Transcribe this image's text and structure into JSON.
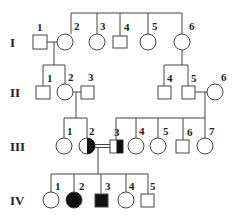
{
  "generations": [
    {
      "label": "I",
      "y": 42
    },
    {
      "label": "II",
      "y": 92
    },
    {
      "label": "III",
      "y": 146
    },
    {
      "label": "IV",
      "y": 200
    }
  ],
  "legend_note": "square = male, circle = female, filled = affected, half-filled = carrier, double line = consanguineous mating",
  "individuals": [
    {
      "id": "I-1",
      "num": "1",
      "sex": "male",
      "status": "unaffected",
      "x": 40,
      "y": 42
    },
    {
      "id": "I-2",
      "num": "2",
      "sex": "female",
      "status": "unaffected",
      "x": 65,
      "y": 42
    },
    {
      "id": "I-3",
      "num": "3",
      "sex": "female",
      "status": "unaffected",
      "x": 96,
      "y": 42
    },
    {
      "id": "I-4",
      "num": "4",
      "sex": "male",
      "status": "unaffected",
      "x": 120,
      "y": 42
    },
    {
      "id": "I-5",
      "num": "5",
      "sex": "female",
      "status": "unaffected",
      "x": 150,
      "y": 42
    },
    {
      "id": "I-6",
      "num": "6",
      "sex": "female",
      "status": "unaffected",
      "x": 182,
      "y": 42
    },
    {
      "id": "II-1",
      "num": "1",
      "sex": "male",
      "status": "unaffected",
      "x": 43,
      "y": 92
    },
    {
      "id": "II-2",
      "num": "2",
      "sex": "female",
      "status": "unaffected",
      "x": 65,
      "y": 92
    },
    {
      "id": "II-3",
      "num": "3",
      "sex": "male",
      "status": "unaffected",
      "x": 87,
      "y": 92
    },
    {
      "id": "II-4",
      "num": "4",
      "sex": "male",
      "status": "unaffected",
      "x": 164,
      "y": 92
    },
    {
      "id": "II-5",
      "num": "5",
      "sex": "male",
      "status": "unaffected",
      "x": 188,
      "y": 92
    },
    {
      "id": "II-6",
      "num": "6",
      "sex": "female",
      "status": "unaffected",
      "x": 215,
      "y": 92
    },
    {
      "id": "III-1",
      "num": "1",
      "sex": "female",
      "status": "unaffected",
      "x": 64,
      "y": 146
    },
    {
      "id": "III-2",
      "num": "2",
      "sex": "female",
      "status": "carrier",
      "x": 87,
      "y": 146
    },
    {
      "id": "III-3",
      "num": "3",
      "sex": "male",
      "status": "carrier",
      "x": 116,
      "y": 146
    },
    {
      "id": "III-4",
      "num": "4",
      "sex": "female",
      "status": "unaffected",
      "x": 136,
      "y": 146
    },
    {
      "id": "III-5",
      "num": "5",
      "sex": "female",
      "status": "unaffected",
      "x": 158,
      "y": 146
    },
    {
      "id": "III-6",
      "num": "6",
      "sex": "male",
      "status": "unaffected",
      "x": 183,
      "y": 146
    },
    {
      "id": "III-7",
      "num": "7",
      "sex": "female",
      "status": "unaffected",
      "x": 205,
      "y": 146
    },
    {
      "id": "IV-1",
      "num": "1",
      "sex": "female",
      "status": "unaffected",
      "x": 51,
      "y": 200
    },
    {
      "id": "IV-2",
      "num": "2",
      "sex": "female",
      "status": "affected",
      "x": 74,
      "y": 200
    },
    {
      "id": "IV-3",
      "num": "3",
      "sex": "male",
      "status": "affected",
      "x": 101,
      "y": 200
    },
    {
      "id": "IV-4",
      "num": "4",
      "sex": "female",
      "status": "unaffected",
      "x": 126,
      "y": 200
    },
    {
      "id": "IV-5",
      "num": "5",
      "sex": "male",
      "status": "unaffected",
      "x": 148,
      "y": 200
    }
  ],
  "matings": [
    {
      "a": "I-1",
      "b": "I-2",
      "consanguineous": false
    },
    {
      "a": "II-2",
      "b": "II-3",
      "consanguineous": false
    },
    {
      "a": "II-5",
      "b": "II-6",
      "consanguineous": false
    },
    {
      "a": "III-2",
      "b": "III-3",
      "consanguineous": true
    }
  ]
}
